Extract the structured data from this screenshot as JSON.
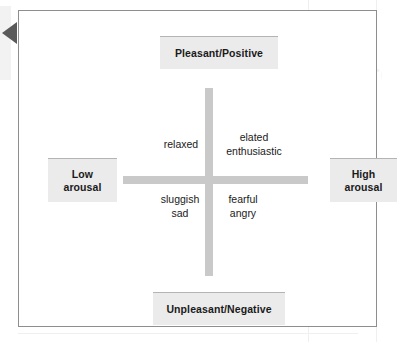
{
  "diagram": {
    "pointer_icon": "left-triangle-marker",
    "accent_color": "#c9c9c9",
    "label_box_color": "#ebebeb",
    "border_color": "#8e8e8e",
    "text_color": "#1a1a1a",
    "ghost_watermark": "Figure",
    "anchors": {
      "top": "Pleasant/Positive",
      "bottom": "Unpleasant/Negative",
      "left": "Low\narousal",
      "right": "High\narousal"
    },
    "quadrants": {
      "upper_left": "relaxed",
      "upper_right": "elated\nenthusiastic",
      "lower_left": "sluggish\nsad",
      "lower_right": "fearful\nangry"
    }
  },
  "chart_data": {
    "type": "scatter",
    "xlabel": "Arousal",
    "ylabel": "Valence",
    "xlim": [
      -1,
      1
    ],
    "ylim": [
      -1,
      1
    ],
    "grid": false,
    "legend": "none",
    "axis_endpoint_labels": {
      "x_min": "Low arousal",
      "x_max": "High arousal",
      "y_max": "Pleasant/Positive",
      "y_min": "Unpleasant/Negative"
    },
    "annotations": [
      {
        "text": "relaxed",
        "x": -0.45,
        "y": 0.35,
        "quadrant": "upper-left"
      },
      {
        "text": "elated enthusiastic",
        "x": 0.45,
        "y": 0.4,
        "quadrant": "upper-right"
      },
      {
        "text": "sluggish sad",
        "x": -0.45,
        "y": -0.35,
        "quadrant": "lower-left"
      },
      {
        "text": "fearful angry",
        "x": 0.45,
        "y": -0.35,
        "quadrant": "lower-right"
      }
    ]
  }
}
